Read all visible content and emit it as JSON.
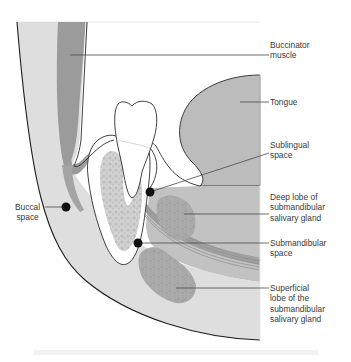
{
  "diagram": {
    "type": "anatomical cross-section",
    "colors": {
      "outline": "#2b2b2b",
      "soft_tissue_light": "#dcdcdc",
      "buccinator_muscle": "#9a9a9a",
      "tongue": "#b9b9b9",
      "bone_mottled": "#c9c9c9",
      "tooth": "#ffffff",
      "gland": "#a8a8a8",
      "mylohyoid_muscle": "#9d9d9d",
      "marker_dot": "#111111",
      "leader_line": "#4a4a4a"
    },
    "labels": [
      {
        "id": "buccinator",
        "text": "Buccinator\nmuscle"
      },
      {
        "id": "tongue",
        "text": "Tongue"
      },
      {
        "id": "sublingual",
        "text": "Sublingual\nspace"
      },
      {
        "id": "deep_lobe",
        "text": "Deep lobe of\nsubmandibular\nsalivary gland"
      },
      {
        "id": "submandibular",
        "text": "Submandibular\nspace"
      },
      {
        "id": "superficial_lobe",
        "text": "Superficial\nlobe of the\nsubmandibular\nsalivary gland"
      },
      {
        "id": "buccal",
        "text": "Buccal\nspace"
      }
    ],
    "markers": [
      {
        "id": "buccal-space-dot",
        "label": "Buccal space"
      },
      {
        "id": "sublingual-space-dot",
        "label": "Sublingual space"
      },
      {
        "id": "submandibular-space-dot",
        "label": "Submandibular space"
      }
    ]
  }
}
